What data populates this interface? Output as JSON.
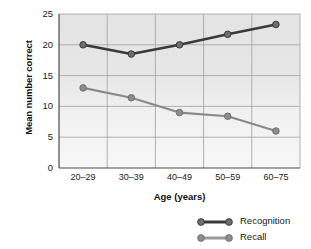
{
  "chart_data": {
    "type": "line",
    "title": "",
    "xlabel": "Age (years)",
    "ylabel": "Mean number correct",
    "categories": [
      "20–29",
      "30–39",
      "40–49",
      "50–59",
      "60–75"
    ],
    "ylim": [
      0,
      25
    ],
    "yticks": [
      0,
      5,
      10,
      15,
      20,
      25
    ],
    "ytick_labels": [
      "0",
      "5",
      "10",
      "15",
      "20",
      "25"
    ],
    "grid": true,
    "legend_position": "bottom-right",
    "series": [
      {
        "name": "Recognition",
        "color": "#3a3a3a",
        "values": [
          20.0,
          18.5,
          20.0,
          21.7,
          23.3
        ]
      },
      {
        "name": "Recall",
        "color": "#8a8a8a",
        "values": [
          13.0,
          11.4,
          9.0,
          8.4,
          6.0
        ]
      }
    ]
  },
  "axes": {
    "y_title": "Mean number correct",
    "x_title": "Age (years)"
  },
  "legend": {
    "items": [
      {
        "label": "Recognition",
        "color": "#3a3a3a"
      },
      {
        "label": "Recall",
        "color": "#8a8a8a"
      }
    ]
  },
  "colors": {
    "recognition": "#3a3a3a",
    "recall": "#8a8a8a",
    "gridline": "#a8a8a8",
    "axis": "#4a4a4a",
    "plot_background": "#e8e8e8"
  }
}
